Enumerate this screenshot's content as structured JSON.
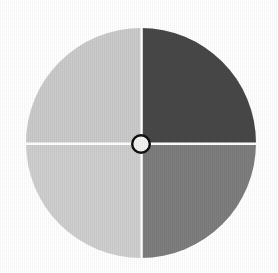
{
  "figure": {
    "background_color": "#ffffff",
    "divider_color": "#ffffff",
    "hub": {
      "name": "center-hub",
      "fill_color": "#f2f2f0",
      "ring_color": "#101010",
      "center_x": 141,
      "center_y": 144,
      "outer_radius": 10,
      "ring_width": 2.4
    },
    "geometry": {
      "center_x": 141,
      "center_y": 143,
      "radius": 115,
      "divider_width": 2.4
    }
  },
  "chart_data": {
    "type": "pie",
    "title": "",
    "subtitle": "",
    "xlabel": "",
    "ylabel": "",
    "grid": false,
    "legend_position": "none",
    "donut": false,
    "start_angle_deg": 0,
    "direction": "clockwise",
    "total": 100,
    "units": "percent",
    "labels": [
      "Top right quadrant",
      "Bottom right quadrant",
      "Bottom left quadrant",
      "Top left quadrant"
    ],
    "values": [
      25,
      25,
      25,
      25
    ],
    "colors": [
      "#474747",
      "#7d7d7d",
      "#cecece",
      "#cacaca"
    ],
    "slices": [
      {
        "label": "Top right quadrant",
        "value": 25,
        "percent": "25%",
        "color": "#474747",
        "start_angle_deg": 0,
        "end_angle_deg": 90,
        "shade": "dark gray"
      },
      {
        "label": "Bottom right quadrant",
        "value": 25,
        "percent": "25%",
        "color": "#7d7d7d",
        "start_angle_deg": 90,
        "end_angle_deg": 180,
        "shade": "medium gray"
      },
      {
        "label": "Bottom left quadrant",
        "value": 25,
        "percent": "25%",
        "color": "#cecece",
        "start_angle_deg": 180,
        "end_angle_deg": 270,
        "shade": "light gray"
      },
      {
        "label": "Top left quadrant",
        "value": 25,
        "percent": "25%",
        "color": "#cacaca",
        "start_angle_deg": 270,
        "end_angle_deg": 360,
        "shade": "light gray"
      }
    ],
    "annotations": [],
    "data_labels_shown": false,
    "tick_labels": []
  }
}
